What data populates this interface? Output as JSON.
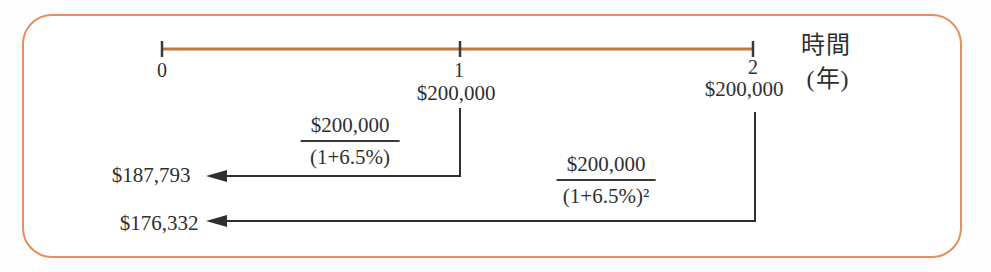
{
  "figure": {
    "axis": {
      "label_line1": "時間",
      "label_line2": "(年)"
    },
    "ticks": [
      {
        "label": "0"
      },
      {
        "label": "1"
      },
      {
        "label": "2"
      }
    ],
    "cashflows": [
      {
        "year": "1",
        "amount": "$200,000"
      },
      {
        "year": "2",
        "amount": "$200,000"
      }
    ],
    "discounts": [
      {
        "numerator": "$200,000",
        "denominator": "(1+6.5%)",
        "result": "$187,793"
      },
      {
        "numerator": "$200,000",
        "denominator": "(1+6.5%)²",
        "result": "$176,332"
      }
    ],
    "colors": {
      "frame_border": "#e58e5e",
      "timeline": "#c07a43",
      "ink": "#2f2f2f"
    }
  }
}
